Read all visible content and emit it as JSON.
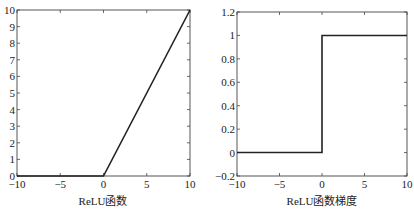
{
  "chart_data": [
    {
      "type": "line",
      "title": "",
      "xlabel": "ReLU函数",
      "ylabel": "",
      "xlim": [
        -10,
        10
      ],
      "ylim": [
        0,
        10
      ],
      "xticks": [
        -10,
        -5,
        0,
        5,
        10
      ],
      "xtick_labels": [
        "−10",
        "−5",
        "0",
        "5",
        "10"
      ],
      "yticks": [
        0,
        1,
        2,
        3,
        4,
        5,
        6,
        7,
        8,
        9,
        10
      ],
      "ytick_labels": [
        "0",
        "1",
        "2",
        "3",
        "4",
        "5",
        "6",
        "7",
        "8",
        "9",
        "10"
      ],
      "grid": false,
      "legend": null,
      "series": [
        {
          "name": "ReLU",
          "x": [
            -10,
            0,
            10
          ],
          "y": [
            0,
            0,
            10
          ]
        }
      ]
    },
    {
      "type": "line",
      "title": "",
      "xlabel": "ReLU函数梯度",
      "ylabel": "",
      "xlim": [
        -10,
        10
      ],
      "ylim": [
        -0.2,
        1.2
      ],
      "xticks": [
        -10,
        -5,
        0,
        5,
        10
      ],
      "xtick_labels": [
        "−10",
        "−5",
        "0",
        "5",
        "10"
      ],
      "yticks": [
        -0.2,
        0,
        0.2,
        0.4,
        0.6,
        0.8,
        1,
        1.2
      ],
      "ytick_labels": [
        "−0.2",
        "0",
        "0.2",
        "0.4",
        "0.6",
        "0.8",
        "1",
        "1.2"
      ],
      "grid": false,
      "legend": null,
      "series": [
        {
          "name": "ReLU gradient",
          "x": [
            -10,
            0,
            0,
            10
          ],
          "y": [
            0,
            0,
            1,
            1
          ]
        }
      ]
    }
  ],
  "plots": {
    "left": {
      "xlabel": "ReLU函数"
    },
    "right": {
      "xlabel": "ReLU函数梯度"
    }
  },
  "colors": {
    "line": "#222222",
    "axis": "#444444",
    "background": "#ffffff"
  }
}
